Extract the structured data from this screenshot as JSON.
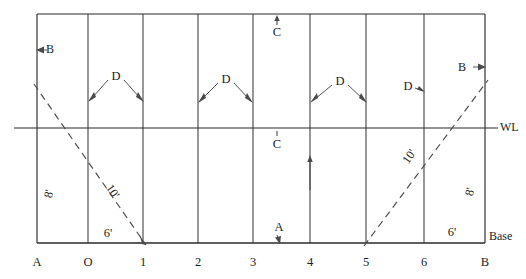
{
  "diagram": {
    "colors": {
      "line": "#2b2b2b",
      "station": "#3a3a3a",
      "dashed": "#4a4a4a",
      "text": "#1d1d1d",
      "background": "#ffffff"
    },
    "geometry": {
      "left_x": 37,
      "right_x": 485,
      "top_y": 14,
      "base_y": 243,
      "waterline_y": 128,
      "wl_extend_left": 14,
      "wl_extend_right": 503,
      "station_x": [
        37,
        88,
        143,
        198,
        253,
        310,
        366,
        424,
        485
      ]
    },
    "axis": {
      "name": "station-axis",
      "labels": [
        {
          "text": "A",
          "x": 37
        },
        {
          "text": "O",
          "x": 88
        },
        {
          "text": "1",
          "x": 143
        },
        {
          "text": "2",
          "x": 198
        },
        {
          "text": "3",
          "x": 253
        },
        {
          "text": "4",
          "x": 310
        },
        {
          "text": "5",
          "x": 366
        },
        {
          "text": "6",
          "x": 424
        },
        {
          "text": "B",
          "x": 485
        }
      ]
    },
    "reference_lines": {
      "waterline_label": "WL",
      "baseline_label": "Base"
    },
    "dimension_labels": {
      "spacing_label": "D",
      "spacing_count": 4,
      "breadth_label": "B",
      "depth_label": "8'",
      "half_breadth_label": "6'",
      "diagonal_label": "10'",
      "centerline_label": "C",
      "aft_label": "A"
    },
    "annotations": [
      {
        "name": "breadth-left",
        "text": "B",
        "x": 50,
        "y": 50
      },
      {
        "name": "breadth-right",
        "text": "B",
        "x": 464,
        "y": 68
      },
      {
        "name": "spacing-1",
        "text": "D",
        "x": 116,
        "y": 77
      },
      {
        "name": "spacing-2",
        "text": "D",
        "x": 226,
        "y": 80
      },
      {
        "name": "spacing-3",
        "text": "D",
        "x": 340,
        "y": 82
      },
      {
        "name": "spacing-4",
        "text": "D",
        "x": 408,
        "y": 87
      },
      {
        "name": "centerline-top",
        "text": "C",
        "x": 277,
        "y": 33
      },
      {
        "name": "centerline-mid",
        "text": "C",
        "x": 277,
        "y": 145
      },
      {
        "name": "aft-marker",
        "text": "A",
        "x": 279,
        "y": 230
      },
      {
        "name": "depth-left",
        "text": "8'",
        "x": 50,
        "y": 194
      },
      {
        "name": "depth-right",
        "text": "8'",
        "x": 471,
        "y": 192
      },
      {
        "name": "halfbreadth-left",
        "text": "6'",
        "x": 108,
        "y": 234
      },
      {
        "name": "halfbreadth-right",
        "text": "6'",
        "x": 452,
        "y": 233
      },
      {
        "name": "diagonal-left",
        "text": "10'",
        "x": 112,
        "y": 192
      },
      {
        "name": "diagonal-right",
        "text": "10'",
        "x": 410,
        "y": 157
      },
      {
        "name": "waterline-label",
        "text": "WL",
        "x": 508,
        "y": 128
      },
      {
        "name": "baseline-label",
        "text": "Base",
        "x": 489,
        "y": 237
      }
    ]
  }
}
